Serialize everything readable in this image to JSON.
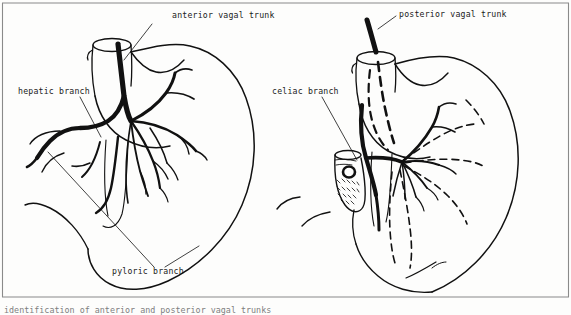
{
  "figure": {
    "frame_color": "#808080",
    "ink_color": "#111111",
    "background": "#fdfdfc",
    "panels": [
      {
        "id": "anterior",
        "name": "anterior-view",
        "description": "Anterior surface of the stomach with the anterior vagal trunk descending on the esophagus and fanning into gastric branches",
        "labels": [
          "anterior vagal trunk",
          "hepatic branch",
          "pyloric branch"
        ]
      },
      {
        "id": "posterior",
        "name": "posterior-view",
        "description": "Posterior surface of the stomach with the posterior vagal trunk and celiac branch; hidden nerve courses shown dashed",
        "labels": [
          "posterior vagal trunk",
          "celiac branch"
        ]
      }
    ]
  },
  "labels": {
    "anterior_vagal_trunk": "anterior vagal trunk",
    "hepatic_branch": "hepatic branch",
    "pyloric_branch": "pyloric branch",
    "posterior_vagal_trunk": "posterior vagal trunk",
    "celiac_branch": "celiac branch"
  },
  "caption": {
    "text": "identification of anterior and posterior vagal trunks"
  }
}
